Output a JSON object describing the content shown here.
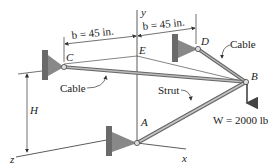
{
  "diagram": {
    "type": "3D statics structure",
    "points": {
      "A": "A",
      "B": "B",
      "C": "C",
      "D": "D",
      "E": "E"
    },
    "axes": {
      "x": "x",
      "y": "y",
      "z": "z"
    },
    "dimensions": {
      "b_left": "b = 45 in.",
      "b_right": "b = 45 in.",
      "H": "H"
    },
    "members": {
      "cable_left": "Cable",
      "cable_right": "Cable",
      "strut": "Strut"
    },
    "load": {
      "label": "W = 2000 lb"
    },
    "colors": {
      "line": "#333333",
      "member": "#9a9a9a",
      "bracket": "#7a7a7a"
    }
  }
}
